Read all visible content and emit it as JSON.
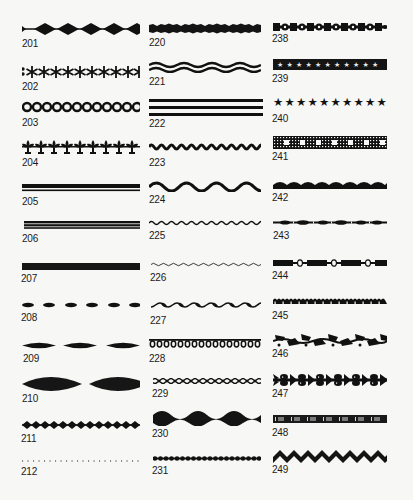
{
  "page": {
    "ink_color": "#111111",
    "background_color": "#f7f7f5"
  },
  "columns": [
    {
      "items": [
        {
          "number": "201",
          "pattern": "diamond-chain"
        },
        {
          "number": "202",
          "pattern": "asterisk-row"
        },
        {
          "number": "203",
          "pattern": "ring-chain"
        },
        {
          "number": "204",
          "pattern": "fleur-de-lis-row"
        },
        {
          "number": "205",
          "pattern": "thick-thin-double-line"
        },
        {
          "number": "206",
          "pattern": "double-line"
        },
        {
          "number": "207",
          "pattern": "solid-bar"
        },
        {
          "number": "208",
          "pattern": "small-lens-dashes"
        },
        {
          "number": "209",
          "pattern": "medium-lens-dashes"
        },
        {
          "number": "210",
          "pattern": "large-lens-dashes"
        },
        {
          "number": "211",
          "pattern": "small-diamond-chain"
        },
        {
          "number": "212",
          "pattern": "dotted-line"
        }
      ]
    },
    {
      "items": [
        {
          "number": "220",
          "pattern": "rough-bar"
        },
        {
          "number": "221",
          "pattern": "double-wave"
        },
        {
          "number": "222",
          "pattern": "triple-line"
        },
        {
          "number": "223",
          "pattern": "tight-wave"
        },
        {
          "number": "224",
          "pattern": "broad-wave"
        },
        {
          "number": "225",
          "pattern": "thin-wave"
        },
        {
          "number": "226",
          "pattern": "hairline-wave"
        },
        {
          "number": "227",
          "pattern": "twisted-rope"
        },
        {
          "number": "228",
          "pattern": "loop-chain"
        },
        {
          "number": "229",
          "pattern": "braid"
        },
        {
          "number": "230",
          "pattern": "heavy-wave-band"
        },
        {
          "number": "231",
          "pattern": "scallop-dots"
        }
      ]
    },
    {
      "items": [
        {
          "number": "238",
          "pattern": "square-circle-chain"
        },
        {
          "number": "239",
          "pattern": "star-band"
        },
        {
          "number": "240",
          "pattern": "star-row"
        },
        {
          "number": "241",
          "pattern": "lattice-band"
        },
        {
          "number": "242",
          "pattern": "scallop-band"
        },
        {
          "number": "243",
          "pattern": "beaded-line"
        },
        {
          "number": "244",
          "pattern": "bar-link-chain"
        },
        {
          "number": "245",
          "pattern": "crenellated-band"
        },
        {
          "number": "246",
          "pattern": "leaf-vine"
        },
        {
          "number": "247",
          "pattern": "laurel-band"
        },
        {
          "number": "248",
          "pattern": "bracket-band"
        },
        {
          "number": "249",
          "pattern": "zigzag-band"
        }
      ]
    }
  ]
}
